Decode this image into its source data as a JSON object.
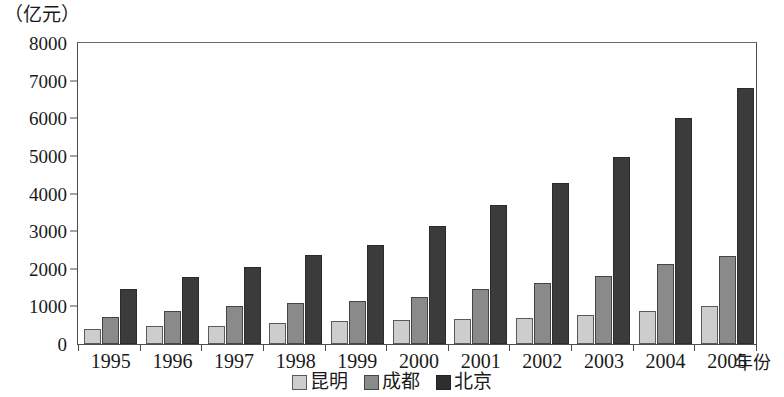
{
  "chart_data": {
    "type": "bar",
    "title": "",
    "subtitle": "",
    "unit_label": "（亿元）",
    "xlabel": "年份",
    "ylabel": "",
    "ylim": [
      0,
      8000
    ],
    "ytick_step": 1000,
    "yticks": [
      0,
      1000,
      2000,
      3000,
      4000,
      5000,
      6000,
      7000,
      8000
    ],
    "ytick_labels": [
      "0",
      "1000",
      "2000",
      "3000",
      "4000",
      "5000",
      "6000",
      "7000",
      "8000"
    ],
    "grid": false,
    "legend_position": "bottom-center",
    "categories": [
      "1995",
      "1996",
      "1997",
      "1998",
      "1999",
      "2000",
      "2001",
      "2002",
      "2003",
      "2004",
      "2005"
    ],
    "series": [
      {
        "name": "昆明",
        "color": "#cdcdcd",
        "values": [
          390,
          470,
          490,
          570,
          600,
          630,
          670,
          700,
          780,
          890,
          1000
        ]
      },
      {
        "name": "成都",
        "color": "#8a8a8a",
        "values": [
          730,
          890,
          1010,
          1080,
          1150,
          1260,
          1460,
          1610,
          1820,
          2130,
          2330
        ]
      },
      {
        "name": "北京",
        "color": "#3b3b3b",
        "values": [
          1450,
          1780,
          2060,
          2370,
          2640,
          3130,
          3690,
          4280,
          4980,
          6000,
          6810
        ]
      }
    ]
  }
}
